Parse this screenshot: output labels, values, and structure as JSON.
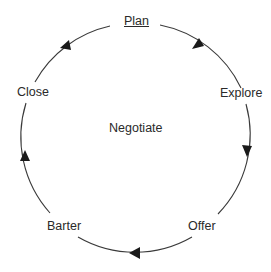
{
  "diagram": {
    "type": "cycle",
    "center_label": "Negotiate",
    "stages": [
      {
        "label": "Plan",
        "underlined": true
      },
      {
        "label": "Explore"
      },
      {
        "label": "Offer"
      },
      {
        "label": "Barter"
      },
      {
        "label": "Close"
      }
    ],
    "direction": "clockwise",
    "line_color": "#333333"
  }
}
